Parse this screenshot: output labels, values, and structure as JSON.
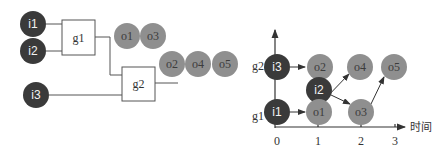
{
  "colors": {
    "input_node": "#3a3a3a",
    "output_node": "#8f8f8f",
    "line": "#555555"
  },
  "circuit": {
    "inputs": [
      {
        "id": "i1",
        "label": "i1"
      },
      {
        "id": "i2",
        "label": "i2"
      },
      {
        "id": "i3",
        "label": "i3"
      }
    ],
    "gates": [
      {
        "id": "g1",
        "label": "g1"
      },
      {
        "id": "g2",
        "label": "g2"
      }
    ],
    "outputs_g1": [
      {
        "label": "o1"
      },
      {
        "label": "o3"
      }
    ],
    "outputs_g2": [
      {
        "label": "o2"
      },
      {
        "label": "o4"
      },
      {
        "label": "o5"
      }
    ]
  },
  "timeline": {
    "x_axis_label": "时间",
    "x_ticks": [
      "0",
      "1",
      "2",
      "3"
    ],
    "y_ticks": [
      "g1",
      "g2"
    ],
    "nodes": {
      "i3": "i3",
      "o2": "o2",
      "i2": "i2",
      "i1": "i1",
      "o1": "o1",
      "o4": "o4",
      "o3": "o3",
      "o5": "o5"
    }
  }
}
